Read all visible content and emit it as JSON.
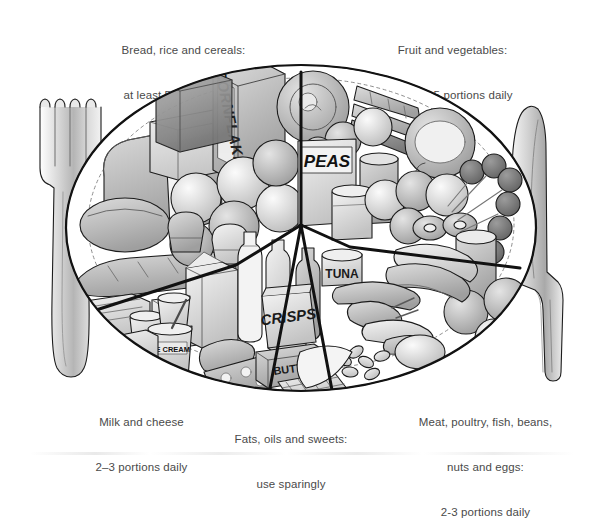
{
  "figure": {
    "title_alt": "Balance of good health plate diagram",
    "background": "#ffffff",
    "ink": "#1a1a1a",
    "text_color": "#4a4a4a"
  },
  "labels": {
    "bread": {
      "line1": "Bread, rice and cereals:",
      "line2": "at least 5 portions daily"
    },
    "fruit": {
      "line1": "Fruit and vegetables:",
      "line2": "at least 5 portions daily"
    },
    "milk": {
      "line1": "Milk and cheese",
      "line2": "2–3 portions daily"
    },
    "fats": {
      "line1": "Fats, oils and sweets:",
      "line2": "use sparingly"
    },
    "meat": {
      "line1": "Meat, poultry, fish, beans,",
      "line2": "nuts and eggs:",
      "line3": "2-3 portions daily"
    }
  },
  "package_text": {
    "cornflakes": "CORNFLAKES",
    "peas": "PEAS",
    "tuna": "TUNA",
    "crisps": "CRISPS",
    "butter": "BUTTER",
    "icecream": "ICE CREAM"
  },
  "cutlery": {
    "left": "fork",
    "right": "knife"
  },
  "segments": [
    {
      "name": "bread-rice-cereals",
      "position": "upper-left"
    },
    {
      "name": "fruit-and-vegetables",
      "position": "upper-right"
    },
    {
      "name": "milk-and-cheese",
      "position": "lower-left"
    },
    {
      "name": "fats-oils-sweets",
      "position": "lower-centre"
    },
    {
      "name": "meat-poultry-fish",
      "position": "lower-right"
    }
  ],
  "palette": {
    "outline": "#1c1c1c",
    "plate_fill": "#ffffff",
    "light": "#e6e6e6",
    "mid": "#c9c9c9",
    "dark": "#9a9a9a",
    "darker": "#747474",
    "deepest": "#555555"
  }
}
